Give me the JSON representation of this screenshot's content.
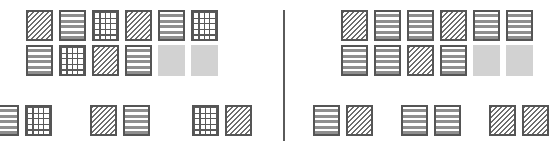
{
  "figure": {
    "title": "",
    "type": "pattern-tile-comparison",
    "canvas": {
      "width": 558,
      "height": 146,
      "background": "#ffffff"
    },
    "divider": {
      "present": true,
      "orientation": "vertical",
      "x": 283,
      "color": "#5a5a5a"
    }
  },
  "legend_patterns": {
    "diagonal": "diagonal-hatch",
    "horizontal": "horizontal-stripes",
    "grid": "cross-grid",
    "plain": "solid-gray"
  },
  "colors": {
    "border": "#555555",
    "hatch": "#6e6e6e",
    "stripe": "#8f8f8f",
    "grid_line": "#5a5a5a",
    "plain_fill": "#d2d2d2",
    "background": "#ffffff",
    "divider": "#5a5a5a"
  },
  "panels": [
    {
      "id": "left",
      "name": "left-panel",
      "upper_rows": [
        {
          "tiles": [
            "diagonal",
            "horizontal",
            "grid",
            "diagonal",
            "horizontal",
            "grid"
          ]
        },
        {
          "tiles": [
            "horizontal",
            "grid",
            "diagonal",
            "horizontal",
            "plain",
            "plain"
          ]
        }
      ],
      "bottom_groups": [
        {
          "tiles": [
            "horizontal",
            "grid"
          ]
        },
        {
          "tiles": [
            "diagonal",
            "horizontal"
          ]
        },
        {
          "tiles": [
            "grid",
            "diagonal"
          ]
        }
      ]
    },
    {
      "id": "right",
      "name": "right-panel",
      "upper_rows": [
        {
          "tiles": [
            "diagonal",
            "horizontal",
            "horizontal",
            "diagonal",
            "horizontal",
            "horizontal"
          ]
        },
        {
          "tiles": [
            "horizontal",
            "horizontal",
            "diagonal",
            "horizontal",
            "plain",
            "plain"
          ]
        }
      ],
      "bottom_groups": [
        {
          "tiles": [
            "horizontal",
            "diagonal"
          ]
        },
        {
          "tiles": [
            "horizontal",
            "horizontal"
          ]
        },
        {
          "tiles": [
            "diagonal",
            "diagonal"
          ]
        }
      ]
    }
  ],
  "counts": {
    "left": {
      "diagonal": 4,
      "horizontal": 5,
      "grid": 5,
      "plain": 2
    },
    "right": {
      "diagonal": 5,
      "horizontal": 9,
      "grid": 0,
      "plain": 2
    }
  }
}
